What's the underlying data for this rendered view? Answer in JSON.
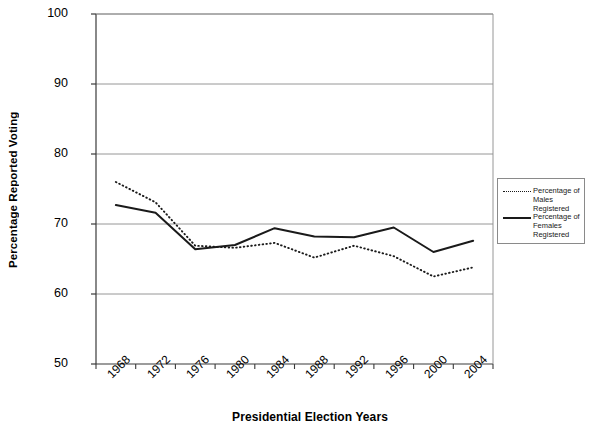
{
  "chart_data": {
    "type": "line",
    "title": "",
    "xlabel": "Presidential Election Years",
    "ylabel": "Percentage Reported Voting",
    "categories": [
      "1968",
      "1972",
      "1976",
      "1980",
      "1984",
      "1988",
      "1992",
      "1996",
      "2000",
      "2004"
    ],
    "x": [
      1968,
      1972,
      1976,
      1980,
      1984,
      1988,
      1992,
      1996,
      2000,
      2004
    ],
    "ylim": [
      50,
      100
    ],
    "yticks": [
      50,
      60,
      70,
      80,
      90,
      100
    ],
    "ytick_labels": [
      "50",
      "60",
      "70",
      "80",
      "90",
      "100"
    ],
    "grid": "horizontal",
    "legend_position": "right-outside",
    "series": [
      {
        "name": "Percentage of Males Registered",
        "style": "dotted",
        "color": "#1a1a1a",
        "values": [
          76.0,
          73.1,
          66.9,
          66.6,
          67.3,
          65.2,
          66.9,
          65.4,
          62.5,
          63.8
        ]
      },
      {
        "name": "Percentage of Females Registered",
        "style": "solid",
        "color": "#1a1a1a",
        "values": [
          72.7,
          71.6,
          66.4,
          67.0,
          69.4,
          68.2,
          68.1,
          69.5,
          66.0,
          67.6
        ]
      }
    ]
  },
  "axes": {
    "y_title": "Percentage Reported Voting",
    "x_title": "Presidential Election Years",
    "y_labels": [
      "100",
      "90",
      "80",
      "70",
      "60",
      "50"
    ],
    "x_labels": [
      "1968",
      "1972",
      "1976",
      "1980",
      "1984",
      "1988",
      "1992",
      "1996",
      "2000",
      "2004"
    ]
  },
  "legend": {
    "entries": [
      {
        "label": "Percentage of Males Registered",
        "style": "dotted"
      },
      {
        "label": "Percentage of Females Registered",
        "style": "solid"
      }
    ]
  },
  "colors": {
    "line": "#1a1a1a",
    "grid": "#8a8a8a",
    "axis": "#4d4d4d",
    "background": "#ffffff"
  }
}
